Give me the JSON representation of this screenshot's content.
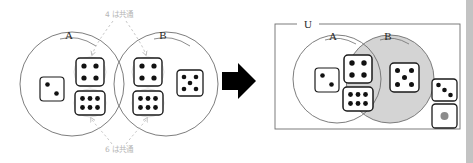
{
  "figure": {
    "type": "venn-diagram-dice",
    "background_color": "#ffffff",
    "shade_color": "#d4d4d4",
    "outline_color": "#6e6e6e",
    "annotation_color": "#b6b6b6",
    "die_face_color": "#ffffff",
    "die_edge_color": "#1a1a1a",
    "pip_color": "#111111",
    "gray_pip_color": "#8c8c8c"
  },
  "left_panel": {
    "name": "two-separate-sets",
    "set_a": {
      "label": "A",
      "members": [
        2,
        4,
        6
      ]
    },
    "set_b": {
      "label": "B",
      "members": [
        4,
        5,
        6
      ]
    },
    "annotations": [
      {
        "id": "top",
        "text": "4 は共通",
        "points_to": [
          4,
          4
        ]
      },
      {
        "id": "bottom",
        "text": "6 は共通",
        "points_to": [
          6,
          6
        ]
      }
    ]
  },
  "arrow": {
    "label": "transforms-into",
    "direction": "right",
    "color": "#000000"
  },
  "right_panel": {
    "name": "merged-venn-diagram",
    "universe": {
      "label": "U"
    },
    "set_a": {
      "label": "A",
      "shaded": false
    },
    "set_b": {
      "label": "B",
      "shaded": true
    },
    "regions": {
      "a_only": [
        2
      ],
      "intersection": [
        4,
        6
      ],
      "b_only": [
        5
      ],
      "outside": [
        3,
        1
      ]
    },
    "outside_gray_pip_value": 1
  },
  "dice_pip_layouts": {
    "1": [
      [
        1,
        1
      ]
    ],
    "2": [
      [
        0,
        0
      ],
      [
        2,
        2
      ]
    ],
    "3": [
      [
        0,
        0
      ],
      [
        1,
        1
      ],
      [
        2,
        2
      ]
    ],
    "4": [
      [
        0,
        0
      ],
      [
        2,
        0
      ],
      [
        0,
        2
      ],
      [
        2,
        2
      ]
    ],
    "5": [
      [
        0,
        0
      ],
      [
        2,
        0
      ],
      [
        1,
        1
      ],
      [
        0,
        2
      ],
      [
        2,
        2
      ]
    ],
    "6": [
      [
        0,
        0
      ],
      [
        1,
        0
      ],
      [
        2,
        0
      ],
      [
        0,
        2
      ],
      [
        1,
        2
      ],
      [
        2,
        2
      ]
    ]
  }
}
